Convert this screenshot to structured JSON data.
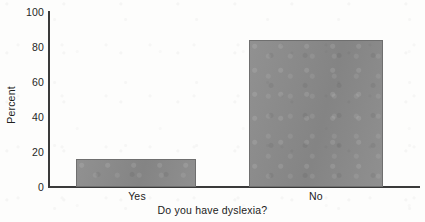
{
  "chart_data": {
    "type": "bar",
    "title": "",
    "subtitle": "",
    "categories": [
      "Yes",
      "No"
    ],
    "values": [
      16,
      84
    ],
    "series": [
      {
        "name": "Percent",
        "values": [
          16,
          84
        ]
      }
    ],
    "xlabel": "Do you have dyslexia?",
    "ylabel": "Percent",
    "ylim": [
      0,
      100
    ],
    "yticks": [
      0,
      20,
      40,
      60,
      80,
      100
    ],
    "ytick_labels": [
      "0",
      "20",
      "40",
      "60",
      "80",
      "100"
    ],
    "grid": false,
    "legend": false,
    "legend_position": "none",
    "bar_color": "#8b8b8b",
    "bar_edge_color": "#6f6f6f",
    "axis_color": "#3a3a3a",
    "background_color": "#fdfdfc",
    "annotations": []
  },
  "axes": {
    "y_title": "Percent",
    "x_title": "Do you have dyslexia?"
  },
  "ticks": {
    "y": [
      {
        "label": "100",
        "value": 100
      },
      {
        "label": "80",
        "value": 80
      },
      {
        "label": "60",
        "value": 60
      },
      {
        "label": "40",
        "value": 40
      },
      {
        "label": "20",
        "value": 20
      },
      {
        "label": "0",
        "value": 0
      }
    ],
    "x": [
      {
        "label": "Yes",
        "value": 16
      },
      {
        "label": "No",
        "value": 84
      }
    ]
  }
}
